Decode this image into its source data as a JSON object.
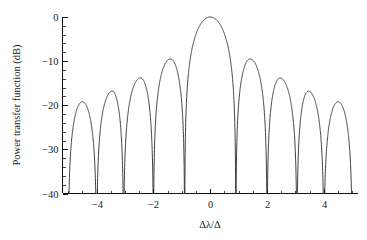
{
  "chart_data": {
    "type": "line",
    "title": "",
    "xlabel": "Δλ/Δ",
    "ylabel": "Power transfer function (dB)",
    "xlim": [
      -5.2,
      5.2
    ],
    "ylim": [
      -40,
      0
    ],
    "grid": false,
    "legend": null,
    "x_major_ticks": [
      -4,
      -2,
      0,
      2,
      4
    ],
    "x_major_tick_labels": [
      "−4",
      "−2",
      "0",
      "2",
      "4"
    ],
    "x_minor_tick_step": 0.5,
    "y_major_ticks": [
      0,
      -10,
      -20,
      -30,
      -40
    ],
    "y_major_tick_labels": [
      "0",
      "−10",
      "−20",
      "−30",
      "−40"
    ],
    "y_minor_tick_step": 2,
    "series": [
      {
        "name": "power transfer function",
        "color": "#2b2b2b",
        "description": "sinc-squared style interference response in dB, main lobe at 0 with symmetric side lobes",
        "peaks": [
          {
            "x": -4.5,
            "y": -19.2
          },
          {
            "x": -3.45,
            "y": -16.8
          },
          {
            "x": -2.45,
            "y": -13.8
          },
          {
            "x": -1.4,
            "y": -9.5
          },
          {
            "x": 0.0,
            "y": 0.0
          },
          {
            "x": 1.4,
            "y": -9.5
          },
          {
            "x": 2.45,
            "y": -13.8
          },
          {
            "x": 3.45,
            "y": -16.8
          },
          {
            "x": 4.5,
            "y": -19.2
          }
        ],
        "nulls": [
          -5.0,
          -4.0,
          -3.05,
          -2.0,
          -0.9,
          0.9,
          2.0,
          3.05,
          4.0,
          5.0
        ]
      }
    ]
  },
  "figure": {
    "caption": "",
    "background_color": "#ffffff",
    "axis_color": "#111111",
    "curve_color": "#2b2b2b"
  }
}
